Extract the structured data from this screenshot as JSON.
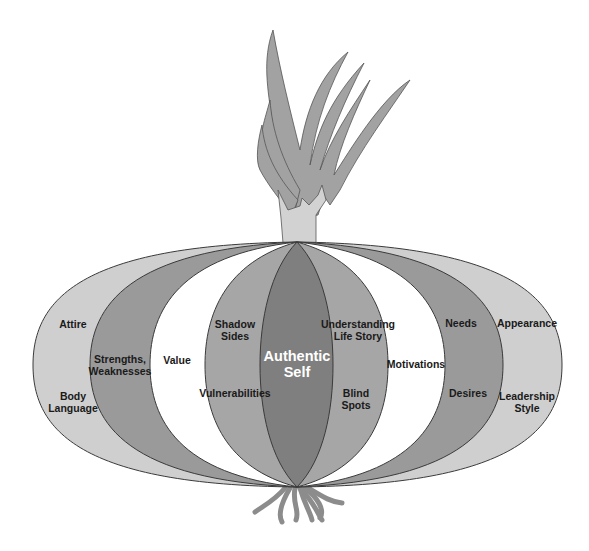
{
  "diagram": {
    "colors": {
      "background": "#ffffff",
      "outline": "#3a3a3a",
      "outer_layer": "#cfcfcf",
      "second_layer": "#9a9a9a",
      "third_layer": "#ffffff",
      "fourth_layer": "#a6a6a6",
      "core": "#7f7f7f",
      "leaves": "#a2a2a2",
      "stem": "#d2d2d2",
      "roots": "#8c8c8c",
      "core_text": "#ffffff",
      "label_text": "#1a1a1a"
    },
    "core": {
      "line1": "Authentic",
      "line2": "Self"
    },
    "layers": [
      {
        "name": "outer",
        "left_labels": [
          {
            "line1": "Attire",
            "line2": ""
          },
          {
            "line1": "Body",
            "line2": "Language"
          }
        ],
        "right_labels": [
          {
            "line1": "Appearance",
            "line2": ""
          },
          {
            "line1": "Leadership",
            "line2": "Style"
          }
        ]
      },
      {
        "name": "second",
        "left_labels": [
          {
            "line1": "Strengths,",
            "line2": "Weaknesses"
          }
        ],
        "right_labels": [
          {
            "line1": "Needs",
            "line2": ""
          },
          {
            "line1": "Desires",
            "line2": ""
          }
        ]
      },
      {
        "name": "third",
        "left_labels": [
          {
            "line1": "Value",
            "line2": ""
          }
        ],
        "right_labels": [
          {
            "line1": "Motivations",
            "line2": ""
          }
        ]
      },
      {
        "name": "fourth",
        "left_labels": [
          {
            "line1": "Shadow",
            "line2": "Sides"
          },
          {
            "line1": "Vulnerabilities",
            "line2": ""
          }
        ],
        "right_labels": [
          {
            "line1": "Understanding",
            "line2": "Life Story"
          },
          {
            "line1": "Blind",
            "line2": "Spots"
          }
        ]
      }
    ]
  }
}
